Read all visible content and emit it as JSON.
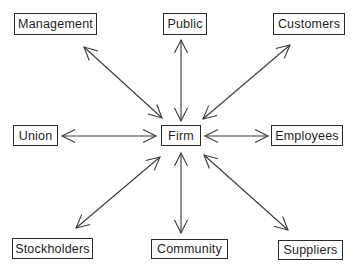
{
  "diagram": {
    "center": {
      "id": "firm",
      "label": "Firm",
      "box": [
        161,
        125,
        40,
        21
      ]
    },
    "nodes": [
      {
        "id": "management",
        "label": "Management",
        "box": [
          14,
          13,
          83,
          22
        ]
      },
      {
        "id": "public",
        "label": "Public",
        "box": [
          163,
          13,
          44,
          22
        ]
      },
      {
        "id": "customers",
        "label": "Customers",
        "box": [
          273,
          13,
          72,
          22
        ]
      },
      {
        "id": "union",
        "label": "Union",
        "box": [
          13,
          125,
          45,
          21
        ]
      },
      {
        "id": "employees",
        "label": "Employees",
        "box": [
          271,
          125,
          72,
          21
        ]
      },
      {
        "id": "stockholders",
        "label": "Stockholders",
        "box": [
          12,
          238,
          81,
          21
        ]
      },
      {
        "id": "community",
        "label": "Community",
        "box": [
          151,
          239,
          77,
          20
        ]
      },
      {
        "id": "suppliers",
        "label": "Suppliers",
        "box": [
          278,
          240,
          65,
          20
        ]
      }
    ],
    "edges": [
      {
        "from": "firm",
        "to": "management",
        "direction": "bidirectional",
        "p1": [
          162,
          118
        ],
        "p2": [
          84,
          47
        ]
      },
      {
        "from": "firm",
        "to": "public",
        "direction": "bidirectional",
        "p1": [
          181,
          121
        ],
        "p2": [
          181,
          40
        ]
      },
      {
        "from": "firm",
        "to": "customers",
        "direction": "bidirectional",
        "p1": [
          203,
          119
        ],
        "p2": [
          290,
          45
        ]
      },
      {
        "from": "firm",
        "to": "union",
        "direction": "bidirectional",
        "p1": [
          156,
          136
        ],
        "p2": [
          62,
          136
        ]
      },
      {
        "from": "firm",
        "to": "employees",
        "direction": "bidirectional",
        "p1": [
          205,
          136
        ],
        "p2": [
          268,
          136
        ]
      },
      {
        "from": "firm",
        "to": "stockholders",
        "direction": "bidirectional",
        "p1": [
          160,
          157
        ],
        "p2": [
          76,
          228
        ]
      },
      {
        "from": "firm",
        "to": "community",
        "direction": "bidirectional",
        "p1": [
          181,
          153
        ],
        "p2": [
          181,
          233
        ]
      },
      {
        "from": "firm",
        "to": "suppliers",
        "direction": "bidirectional",
        "p1": [
          204,
          155
        ],
        "p2": [
          288,
          230
        ]
      }
    ],
    "colors": {
      "stroke": "#3a3a3a",
      "text": "#1e1e1e",
      "background": "#ffffff"
    }
  }
}
